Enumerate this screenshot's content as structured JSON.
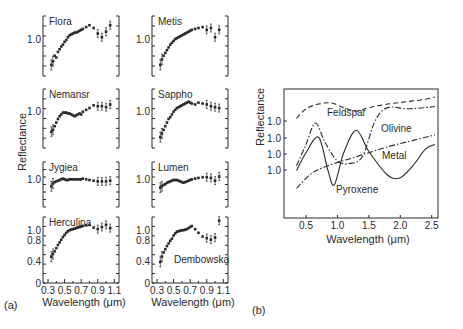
{
  "figure": {
    "panel_a_label": "(a)",
    "panel_b_label": "(b)",
    "a_ylabel": "Reflectance",
    "a_xlabel": "Wavelength (μm)",
    "b_ylabel": "Reflectance",
    "b_xlabel": "Wavelength (μm)"
  },
  "chart_data": [
    {
      "type": "scatter",
      "title": "Asteroid reflectance spectra (a)",
      "xlabel": "Wavelength (μm)",
      "ylabel": "Reflectance",
      "xlim": [
        0.3,
        1.1
      ],
      "x_ticks": [
        "0.3",
        "0.5",
        "0.7",
        "0.9",
        "1.1"
      ],
      "panels": [
        {
          "name": "Flora",
          "ytick": "1.0",
          "x": [
            0.34,
            0.36,
            0.38,
            0.4,
            0.42,
            0.44,
            0.46,
            0.48,
            0.5,
            0.52,
            0.54,
            0.56,
            0.58,
            0.6,
            0.62,
            0.64,
            0.66,
            0.68,
            0.7,
            0.72,
            0.76,
            0.8,
            0.85,
            0.9,
            0.95,
            1.0,
            1.05
          ],
          "y": [
            0.72,
            0.76,
            0.82,
            0.8,
            0.86,
            0.89,
            0.92,
            0.94,
            0.97,
            0.99,
            1.02,
            1.04,
            1.05,
            1.06,
            1.07,
            1.07,
            1.08,
            1.09,
            1.1,
            1.11,
            1.13,
            1.15,
            1.12,
            1.06,
            1.02,
            1.08,
            1.15
          ]
        },
        {
          "name": "Nemansr",
          "ytick": "1.0",
          "x": [
            0.34,
            0.36,
            0.38,
            0.4,
            0.42,
            0.44,
            0.46,
            0.48,
            0.5,
            0.52,
            0.54,
            0.56,
            0.58,
            0.6,
            0.62,
            0.64,
            0.66,
            0.68,
            0.7,
            0.72,
            0.76,
            0.8,
            0.85,
            0.9,
            0.95,
            1.0,
            1.05
          ],
          "y": [
            0.78,
            0.8,
            0.84,
            0.88,
            0.92,
            0.95,
            0.97,
            0.99,
            0.99,
            0.99,
            0.98,
            0.98,
            0.97,
            0.96,
            0.95,
            0.96,
            0.97,
            0.98,
            0.97,
            1.0,
            1.02,
            1.04,
            1.07,
            1.06,
            1.06,
            1.05,
            1.08
          ]
        },
        {
          "name": "Jygiea",
          "ytick": "1.0",
          "x": [
            0.34,
            0.36,
            0.38,
            0.4,
            0.42,
            0.44,
            0.46,
            0.48,
            0.5,
            0.52,
            0.54,
            0.56,
            0.58,
            0.6,
            0.62,
            0.64,
            0.66,
            0.68,
            0.7,
            0.72,
            0.76,
            0.8,
            0.85,
            0.9,
            0.95,
            1.0,
            1.05
          ],
          "y": [
            0.9,
            0.94,
            0.96,
            0.97,
            0.98,
            0.99,
            1.0,
            1.01,
            1.0,
            0.99,
            0.99,
            1.0,
            1.0,
            1.0,
            1.0,
            1.0,
            1.0,
            1.0,
            1.0,
            1.01,
            1.0,
            0.99,
            0.98,
            0.97,
            0.97,
            0.97,
            0.98
          ]
        },
        {
          "name": "Herculina",
          "yticks": [
            "0",
            "0.4",
            "0.8",
            "1.0"
          ],
          "x": [
            0.34,
            0.36,
            0.38,
            0.4,
            0.42,
            0.44,
            0.46,
            0.48,
            0.5,
            0.52,
            0.54,
            0.56,
            0.58,
            0.6,
            0.62,
            0.64,
            0.66,
            0.68,
            0.7,
            0.72,
            0.76,
            0.8,
            0.85,
            0.9,
            0.95,
            1.0,
            1.05
          ],
          "y": [
            0.5,
            0.55,
            0.6,
            0.66,
            0.72,
            0.77,
            0.82,
            0.87,
            0.91,
            0.95,
            0.98,
            1.0,
            1.01,
            1.02,
            1.03,
            1.04,
            1.05,
            1.06,
            1.07,
            1.08,
            1.09,
            1.1,
            1.05,
            1.02,
            1.06,
            1.1,
            1.04
          ]
        },
        {
          "name": "Metis",
          "ytick": "1.0",
          "x": [
            0.34,
            0.36,
            0.38,
            0.4,
            0.42,
            0.44,
            0.46,
            0.48,
            0.5,
            0.52,
            0.54,
            0.56,
            0.58,
            0.6,
            0.62,
            0.64,
            0.66,
            0.68,
            0.7,
            0.72,
            0.76,
            0.8,
            0.85,
            0.9,
            0.95,
            1.0,
            1.05
          ],
          "y": [
            0.72,
            0.78,
            0.82,
            0.85,
            0.88,
            0.91,
            0.94,
            0.96,
            0.98,
            1.0,
            1.01,
            1.02,
            1.03,
            1.04,
            1.05,
            1.06,
            1.07,
            1.08,
            1.09,
            1.1,
            1.11,
            1.12,
            1.13,
            1.1,
            1.12,
            1.02,
            1.1
          ]
        },
        {
          "name": "Sappho",
          "ytick": "1.0",
          "x": [
            0.34,
            0.36,
            0.38,
            0.4,
            0.42,
            0.44,
            0.46,
            0.48,
            0.5,
            0.52,
            0.54,
            0.56,
            0.58,
            0.6,
            0.62,
            0.64,
            0.66,
            0.68,
            0.7,
            0.72,
            0.76,
            0.8,
            0.85,
            0.9,
            0.95,
            1.0,
            1.05
          ],
          "y": [
            0.72,
            0.76,
            0.8,
            0.84,
            0.88,
            0.92,
            0.94,
            0.97,
            1.0,
            1.02,
            1.04,
            1.05,
            1.06,
            1.07,
            1.08,
            1.09,
            1.1,
            1.11,
            1.1,
            1.09,
            1.08,
            1.1,
            1.09,
            1.08,
            1.06,
            1.05,
            1.04
          ]
        },
        {
          "name": "Lumen",
          "ytick": "1.0",
          "x": [
            0.34,
            0.36,
            0.38,
            0.4,
            0.42,
            0.44,
            0.46,
            0.48,
            0.5,
            0.52,
            0.54,
            0.56,
            0.58,
            0.6,
            0.62,
            0.64,
            0.66,
            0.68,
            0.7,
            0.72,
            0.76,
            0.8,
            0.85,
            0.9,
            0.95,
            1.0,
            1.05
          ],
          "y": [
            0.88,
            0.9,
            0.92,
            0.93,
            0.95,
            0.96,
            0.97,
            0.98,
            0.99,
            0.99,
            0.99,
            0.98,
            0.97,
            0.96,
            0.95,
            0.96,
            0.97,
            0.98,
            0.99,
            1.0,
            1.01,
            1.02,
            1.03,
            1.03,
            1.02,
            0.98,
            1.04
          ]
        },
        {
          "name": "Dembowska",
          "yticks": [
            "0",
            "0.4",
            "0.8",
            "1.0"
          ],
          "x": [
            0.34,
            0.36,
            0.38,
            0.4,
            0.42,
            0.44,
            0.46,
            0.48,
            0.5,
            0.52,
            0.54,
            0.56,
            0.58,
            0.6,
            0.62,
            0.64,
            0.66,
            0.68,
            0.7,
            0.72,
            0.76,
            0.8,
            0.85,
            0.9,
            0.95,
            1.0,
            1.05
          ],
          "y": [
            0.4,
            0.5,
            0.58,
            0.64,
            0.7,
            0.75,
            0.8,
            0.84,
            0.9,
            0.94,
            0.97,
            0.98,
            0.99,
            1.0,
            1.0,
            1.01,
            1.02,
            1.04,
            1.06,
            1.08,
            1.02,
            0.95,
            0.88,
            0.85,
            0.82,
            0.86,
            1.18
          ]
        }
      ]
    },
    {
      "type": "line",
      "title": "Laboratory mineral reflectance spectra (b)",
      "xlabel": "Wavelength (μm)",
      "ylabel": "Reflectance",
      "xlim": [
        0.3,
        2.6
      ],
      "x_ticks": [
        "0.5",
        "1.0",
        "1.5",
        "2.0",
        "2.5"
      ],
      "y_ticks": [
        "1.0",
        "1.0",
        "1.0",
        "1.0"
      ],
      "series": [
        {
          "name": "Feldspar",
          "style": "dashed",
          "x": [
            0.35,
            0.5,
            0.7,
            0.9,
            1.1,
            1.3,
            1.5,
            1.8,
            2.1,
            2.4,
            2.55
          ],
          "y": [
            0.84,
            0.92,
            0.96,
            0.97,
            0.93,
            0.9,
            0.93,
            0.96,
            0.98,
            1.0,
            1.02
          ]
        },
        {
          "name": "Olivine",
          "style": "dash-dot",
          "x": [
            0.35,
            0.5,
            0.65,
            0.8,
            1.0,
            1.2,
            1.4,
            1.6,
            1.8,
            2.1,
            2.4,
            2.55
          ],
          "y": [
            0.44,
            0.62,
            0.8,
            0.64,
            0.48,
            0.46,
            0.52,
            0.82,
            0.93,
            0.92,
            0.93,
            0.94
          ]
        },
        {
          "name": "Metal",
          "style": "dash-dot",
          "x": [
            0.35,
            0.6,
            0.9,
            1.2,
            1.5,
            1.8,
            2.1,
            2.4,
            2.55
          ],
          "y": [
            0.25,
            0.38,
            0.45,
            0.5,
            0.55,
            0.6,
            0.64,
            0.68,
            0.7
          ]
        },
        {
          "name": "Pyroxene",
          "style": "solid",
          "x": [
            0.35,
            0.5,
            0.7,
            0.85,
            0.95,
            1.1,
            1.3,
            1.5,
            1.8,
            2.0,
            2.2,
            2.4,
            2.55
          ],
          "y": [
            0.4,
            0.55,
            0.68,
            0.4,
            0.28,
            0.55,
            0.74,
            0.56,
            0.36,
            0.34,
            0.44,
            0.58,
            0.62
          ]
        }
      ]
    }
  ]
}
